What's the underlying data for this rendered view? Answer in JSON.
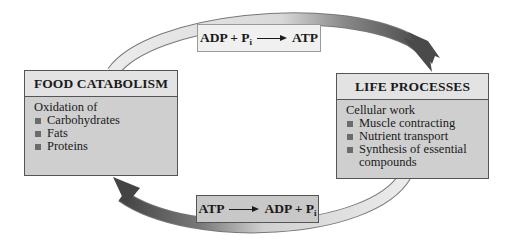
{
  "diagram": {
    "type": "cycle",
    "colors": {
      "ring_light": "#e6e6e6",
      "ring_dark": "#555555",
      "box_fill": "#cfcfcf",
      "box_header": "#e3e3e3",
      "top_equation_fill": "#f0f0f0",
      "bottom_equation_fill": "#c8c8c8"
    },
    "food_catabolism": {
      "title": "FOOD CATABOLISM",
      "intro": "Oxidation of",
      "items": [
        "Carbohydrates",
        "Fats",
        "Proteins"
      ]
    },
    "life_processes": {
      "title": "LIFE PROCESSES",
      "intro": "Cellular work",
      "items": [
        "Muscle contracting",
        "Nutrient transport",
        "Synthesis of essential",
        "compounds"
      ]
    },
    "top_reaction": {
      "left": "ADP + P",
      "left_sub": "i",
      "right": "ATP"
    },
    "bottom_reaction": {
      "left": "ATP",
      "right": "ADP + P",
      "right_sub": "i"
    }
  }
}
